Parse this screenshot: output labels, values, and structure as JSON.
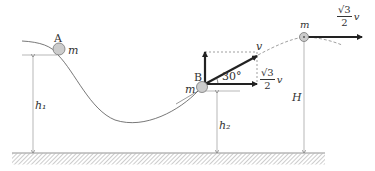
{
  "diagram": {
    "labels": {
      "point_a": "A",
      "point_b": "B",
      "mass_a": "m",
      "mass_b": "m",
      "mass_top": "m",
      "height_h1": "h₁",
      "height_h2": "h₂",
      "height_H": "H",
      "velocity_v": "v",
      "angle": "30°",
      "horizontal_component": {
        "numerator": "√3",
        "denominator": "2",
        "symbol": "v"
      },
      "top_velocity": {
        "numerator": "√3",
        "denominator": "2",
        "symbol": "v"
      }
    },
    "colors": {
      "line": "#555555",
      "arrow": "#222222",
      "ball_fill": "#cccccc",
      "hatch": "#999999"
    }
  }
}
